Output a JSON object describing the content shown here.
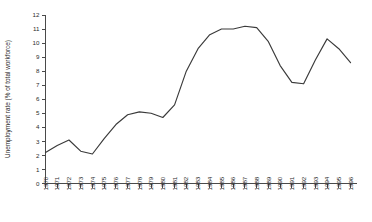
{
  "chart_data": {
    "type": "line",
    "title": "",
    "xlabel": "",
    "ylabel": "Unemployment rate (% of total workforce)",
    "ylim": [
      0,
      12
    ],
    "yticks": [
      0,
      1,
      2,
      3,
      4,
      5,
      6,
      7,
      8,
      9,
      10,
      11,
      12
    ],
    "ytick_labels": [
      "0",
      "1",
      "2",
      "3",
      "4",
      "5",
      "6",
      "7",
      "8",
      "9",
      "10",
      "11",
      "12"
    ],
    "grid": false,
    "legend": "none",
    "line_color": "#3a3a3a",
    "categories": [
      "1970",
      "1971",
      "1972",
      "1973",
      "1974",
      "1975",
      "1976",
      "1977",
      "1978",
      "1979",
      "1980",
      "1981",
      "1982",
      "1983",
      "1984",
      "1985",
      "1986",
      "1987",
      "1988",
      "1989",
      "1990",
      "1991",
      "1992",
      "1993",
      "1994",
      "1995",
      "1996"
    ],
    "values": [
      2.2,
      2.7,
      3.1,
      2.3,
      2.1,
      3.2,
      4.2,
      4.9,
      5.1,
      5.0,
      4.7,
      5.6,
      8.0,
      9.6,
      10.6,
      11.0,
      11.0,
      11.2,
      11.1,
      10.1,
      8.4,
      7.2,
      7.1,
      8.8,
      10.3,
      9.6,
      8.6
    ],
    "series": [
      {
        "name": "Unemployment rate",
        "values": [
          2.2,
          2.7,
          3.1,
          2.3,
          2.1,
          3.2,
          4.2,
          4.9,
          5.1,
          5.0,
          4.7,
          5.6,
          8.0,
          9.6,
          10.6,
          11.0,
          11.0,
          11.2,
          11.1,
          10.1,
          8.4,
          7.2,
          7.1,
          8.8,
          10.3,
          9.6,
          8.6
        ]
      }
    ]
  }
}
